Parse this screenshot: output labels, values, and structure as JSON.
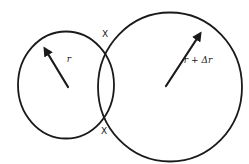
{
  "figure": {
    "labels": {
      "small_radius": "r",
      "large_radius": "r + Δr",
      "intersection_top": "X",
      "intersection_bottom": "X"
    },
    "colors": {
      "stroke": "#1a1a1a",
      "background": "#ffffff"
    }
  }
}
